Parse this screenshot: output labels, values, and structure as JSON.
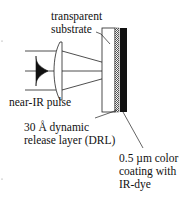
{
  "diagram": {
    "type": "laser-induced forward transfer schematic",
    "labels": {
      "substrate_line1": "transparent",
      "substrate_line2": "substrate",
      "pulse": "near-IR pulse",
      "drl_line1": "30 Å dynamic",
      "drl_line2": "release layer (DRL)",
      "coating_line1": "0.5 µm color",
      "coating_line2": "coating with",
      "coating_line3": "IR-dye"
    },
    "components": [
      {
        "name": "near-IR pulse",
        "shape": "gaussian-profile"
      },
      {
        "name": "focusing lens",
        "shape": "plano-convex"
      },
      {
        "name": "transparent substrate",
        "shape": "rectangle",
        "fill": "#ffffff"
      },
      {
        "name": "dynamic release layer",
        "shape": "thin strip",
        "fill": "hatched"
      },
      {
        "name": "color coating",
        "shape": "rectangle",
        "fill": "#111111"
      }
    ],
    "colors": {
      "line": "#222222",
      "coating": "#111111",
      "background": "#ffffff"
    }
  }
}
